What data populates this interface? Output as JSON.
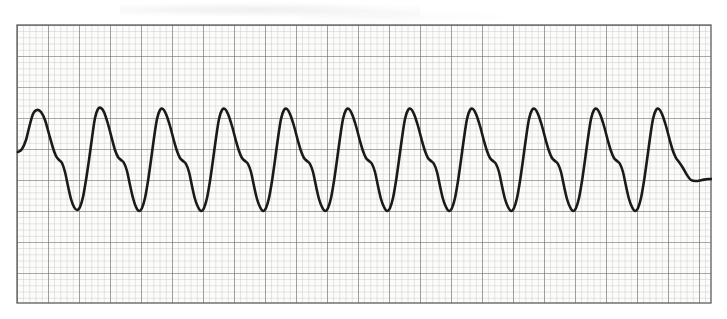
{
  "document": {
    "type": "ecg-rhythm-strip",
    "caption": ""
  },
  "paper": {
    "background_color": "#fcfcfb",
    "minor_grid_color": "#9b9b9b",
    "major_grid_color": "#6d6d6d",
    "border_color": "#5e5e5e",
    "minor_cell_px": 6.2,
    "major_cell_px": 31.0,
    "minor_per_major": 5,
    "left_px": 16,
    "top_px": 24,
    "width_px": 696,
    "height_px": 280
  },
  "trace": {
    "color": "#1a1a1a",
    "stroke_width_px": 2.6,
    "baseline_y_px": 152,
    "peak_y_px": 110,
    "trough_y_px": 209,
    "shoulder_y_px": 158,
    "start_x_px": 18,
    "end_x_px": 712,
    "end_y_px": 180,
    "cycle_period_px": 55,
    "first_peak_x_px": 33,
    "beat_count": 13
  },
  "chart_data": {
    "type": "line",
    "title": "",
    "subtitle": "",
    "xlabel": "",
    "ylabel": "",
    "legend": [],
    "grid": true,
    "interpretation": "monomorphic ventricular tachycardia",
    "paper_speed": "25 mm/s",
    "gain": "10 mm/mV",
    "small_box_time_s": 0.04,
    "large_box_time_s": 0.2,
    "small_box_voltage_mv": 0.1,
    "large_box_voltage_mv": 0.5,
    "x_unit": "px",
    "y_unit": "px",
    "xlim": [
      16,
      712
    ],
    "ylim": [
      24,
      304
    ],
    "series": [
      {
        "name": "lead-ii",
        "description": "wide-complex sine-like ventricular tachycardia waveform",
        "points": [
          [
            18,
            152
          ],
          [
            22,
            149
          ],
          [
            26,
            140
          ],
          [
            29,
            128
          ],
          [
            33,
            114
          ],
          [
            37,
            110
          ],
          [
            41,
            112
          ],
          [
            45,
            120
          ],
          [
            49,
            134
          ],
          [
            53,
            148
          ],
          [
            56,
            156
          ],
          [
            59,
            160
          ],
          [
            62,
            163
          ],
          [
            65,
            172
          ],
          [
            68,
            186
          ],
          [
            71,
            199
          ],
          [
            74,
            207
          ],
          [
            77,
            210
          ],
          [
            80,
            207
          ],
          [
            83,
            197
          ],
          [
            86,
            180
          ],
          [
            89,
            160
          ],
          [
            92,
            138
          ],
          [
            95,
            118
          ],
          [
            98,
            109
          ],
          [
            101,
            108
          ],
          [
            104,
            112
          ],
          [
            108,
            124
          ],
          [
            112,
            139
          ],
          [
            115,
            150
          ],
          [
            118,
            157
          ],
          [
            121,
            160
          ],
          [
            124,
            163
          ],
          [
            127,
            171
          ],
          [
            130,
            185
          ],
          [
            133,
            198
          ],
          [
            136,
            207
          ],
          [
            139,
            211
          ],
          [
            142,
            208
          ],
          [
            145,
            198
          ],
          [
            148,
            181
          ],
          [
            151,
            160
          ],
          [
            154,
            138
          ],
          [
            157,
            119
          ],
          [
            160,
            110
          ],
          [
            163,
            109
          ],
          [
            166,
            114
          ],
          [
            170,
            126
          ],
          [
            174,
            141
          ],
          [
            177,
            151
          ],
          [
            180,
            158
          ],
          [
            183,
            161
          ],
          [
            186,
            164
          ],
          [
            189,
            172
          ],
          [
            192,
            186
          ],
          [
            195,
            199
          ],
          [
            198,
            207
          ],
          [
            201,
            211
          ],
          [
            204,
            208
          ],
          [
            207,
            198
          ],
          [
            210,
            181
          ],
          [
            213,
            160
          ],
          [
            216,
            138
          ],
          [
            219,
            119
          ],
          [
            222,
            110
          ],
          [
            225,
            109
          ],
          [
            228,
            114
          ],
          [
            232,
            126
          ],
          [
            236,
            141
          ],
          [
            239,
            151
          ],
          [
            242,
            158
          ],
          [
            245,
            161
          ],
          [
            248,
            164
          ],
          [
            251,
            172
          ],
          [
            254,
            186
          ],
          [
            257,
            199
          ],
          [
            260,
            207
          ],
          [
            263,
            211
          ],
          [
            266,
            208
          ],
          [
            269,
            198
          ],
          [
            272,
            181
          ],
          [
            275,
            160
          ],
          [
            278,
            138
          ],
          [
            281,
            119
          ],
          [
            284,
            110
          ],
          [
            287,
            109
          ],
          [
            290,
            114
          ],
          [
            294,
            126
          ],
          [
            298,
            141
          ],
          [
            301,
            151
          ],
          [
            304,
            158
          ],
          [
            307,
            161
          ],
          [
            310,
            164
          ],
          [
            313,
            172
          ],
          [
            316,
            186
          ],
          [
            319,
            199
          ],
          [
            322,
            207
          ],
          [
            325,
            211
          ],
          [
            328,
            208
          ],
          [
            331,
            198
          ],
          [
            334,
            181
          ],
          [
            337,
            160
          ],
          [
            340,
            138
          ],
          [
            343,
            119
          ],
          [
            346,
            110
          ],
          [
            349,
            109
          ],
          [
            352,
            114
          ],
          [
            356,
            126
          ],
          [
            360,
            141
          ],
          [
            363,
            151
          ],
          [
            366,
            158
          ],
          [
            369,
            161
          ],
          [
            372,
            164
          ],
          [
            375,
            172
          ],
          [
            378,
            186
          ],
          [
            381,
            199
          ],
          [
            384,
            207
          ],
          [
            387,
            211
          ],
          [
            390,
            208
          ],
          [
            393,
            198
          ],
          [
            396,
            181
          ],
          [
            399,
            160
          ],
          [
            402,
            138
          ],
          [
            405,
            119
          ],
          [
            408,
            110
          ],
          [
            411,
            109
          ],
          [
            414,
            114
          ],
          [
            418,
            126
          ],
          [
            422,
            141
          ],
          [
            425,
            151
          ],
          [
            428,
            158
          ],
          [
            431,
            161
          ],
          [
            434,
            164
          ],
          [
            437,
            172
          ],
          [
            440,
            186
          ],
          [
            443,
            199
          ],
          [
            446,
            207
          ],
          [
            449,
            211
          ],
          [
            452,
            208
          ],
          [
            455,
            198
          ],
          [
            458,
            181
          ],
          [
            461,
            160
          ],
          [
            464,
            138
          ],
          [
            467,
            119
          ],
          [
            470,
            110
          ],
          [
            473,
            109
          ],
          [
            476,
            114
          ],
          [
            480,
            126
          ],
          [
            484,
            141
          ],
          [
            487,
            151
          ],
          [
            490,
            158
          ],
          [
            493,
            161
          ],
          [
            496,
            164
          ],
          [
            499,
            172
          ],
          [
            502,
            186
          ],
          [
            505,
            199
          ],
          [
            508,
            207
          ],
          [
            511,
            211
          ],
          [
            514,
            208
          ],
          [
            517,
            198
          ],
          [
            520,
            181
          ],
          [
            523,
            160
          ],
          [
            526,
            138
          ],
          [
            529,
            119
          ],
          [
            532,
            110
          ],
          [
            535,
            109
          ],
          [
            538,
            114
          ],
          [
            542,
            126
          ],
          [
            546,
            141
          ],
          [
            549,
            151
          ],
          [
            552,
            158
          ],
          [
            555,
            161
          ],
          [
            558,
            164
          ],
          [
            561,
            172
          ],
          [
            564,
            186
          ],
          [
            567,
            199
          ],
          [
            570,
            207
          ],
          [
            573,
            211
          ],
          [
            576,
            208
          ],
          [
            579,
            198
          ],
          [
            582,
            181
          ],
          [
            585,
            160
          ],
          [
            588,
            138
          ],
          [
            591,
            119
          ],
          [
            594,
            110
          ],
          [
            597,
            109
          ],
          [
            600,
            114
          ],
          [
            604,
            126
          ],
          [
            608,
            141
          ],
          [
            611,
            151
          ],
          [
            614,
            158
          ],
          [
            617,
            161
          ],
          [
            620,
            164
          ],
          [
            623,
            172
          ],
          [
            626,
            186
          ],
          [
            629,
            199
          ],
          [
            632,
            207
          ],
          [
            635,
            211
          ],
          [
            638,
            208
          ],
          [
            641,
            198
          ],
          [
            644,
            181
          ],
          [
            647,
            160
          ],
          [
            650,
            138
          ],
          [
            653,
            119
          ],
          [
            656,
            110
          ],
          [
            659,
            109
          ],
          [
            662,
            114
          ],
          [
            666,
            126
          ],
          [
            670,
            141
          ],
          [
            673,
            151
          ],
          [
            676,
            158
          ],
          [
            679,
            162
          ],
          [
            683,
            168
          ],
          [
            687,
            175
          ],
          [
            691,
            180
          ],
          [
            696,
            181
          ],
          [
            702,
            180
          ],
          [
            708,
            179
          ],
          [
            712,
            179
          ]
        ]
      }
    ]
  }
}
